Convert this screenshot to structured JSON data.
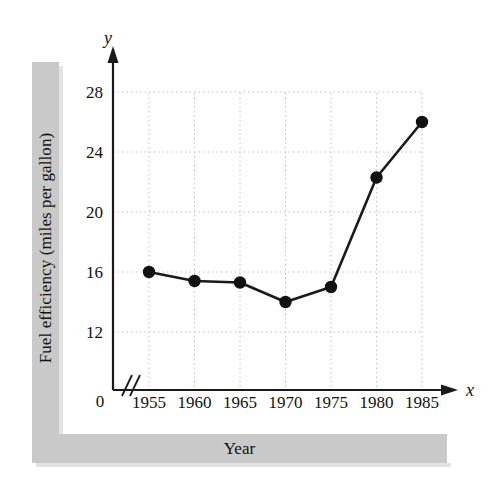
{
  "figure": {
    "y_axis_band_label": "Fuel efficiency (miles per gallon)",
    "x_axis_band_label": "Year",
    "origin_label": "0",
    "x_axis_letter": "x",
    "y_axis_letter": "y"
  },
  "chart_data": {
    "type": "line",
    "title": "",
    "xlabel": "Year",
    "ylabel": "Fuel efficiency (miles per gallon)",
    "x": [
      1955,
      1960,
      1965,
      1970,
      1975,
      1980,
      1985
    ],
    "values": [
      16.0,
      15.4,
      15.3,
      14.0,
      15.0,
      22.3,
      26.0
    ],
    "xtick_labels": [
      "1955",
      "1960",
      "1965",
      "1970",
      "1975",
      "1980",
      "1985"
    ],
    "ytick_labels": [
      "12",
      "16",
      "20",
      "24",
      "28"
    ],
    "yticks": [
      12,
      16,
      20,
      24,
      28
    ],
    "xlim": [
      1955,
      1985
    ],
    "ylim": [
      10,
      29
    ],
    "grid": true,
    "grid_style": "dotted",
    "legend": "none",
    "axis_break": true,
    "marker": "filled-circle",
    "line_color": "#1a1a1a",
    "marker_color": "#111111",
    "grid_color": "#c0c0c0",
    "band_color": "#c9c9c9"
  }
}
